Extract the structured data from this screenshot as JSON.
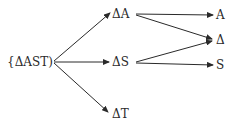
{
  "diagram": {
    "nodes": [
      {
        "id": "root",
        "label": "{ΔAST)"
      },
      {
        "id": "dA",
        "label": "ΔA"
      },
      {
        "id": "dS",
        "label": "ΔS"
      },
      {
        "id": "dT",
        "label": "ΔT"
      },
      {
        "id": "A",
        "label": "A"
      },
      {
        "id": "Delta",
        "label": "Δ"
      },
      {
        "id": "S",
        "label": "S"
      }
    ],
    "edges": [
      {
        "from": "root",
        "to": "dA"
      },
      {
        "from": "root",
        "to": "dS"
      },
      {
        "from": "root",
        "to": "dT"
      },
      {
        "from": "dA",
        "to": "A"
      },
      {
        "from": "dA",
        "to": "Delta"
      },
      {
        "from": "dS",
        "to": "Delta"
      },
      {
        "from": "dS",
        "to": "S"
      }
    ]
  }
}
